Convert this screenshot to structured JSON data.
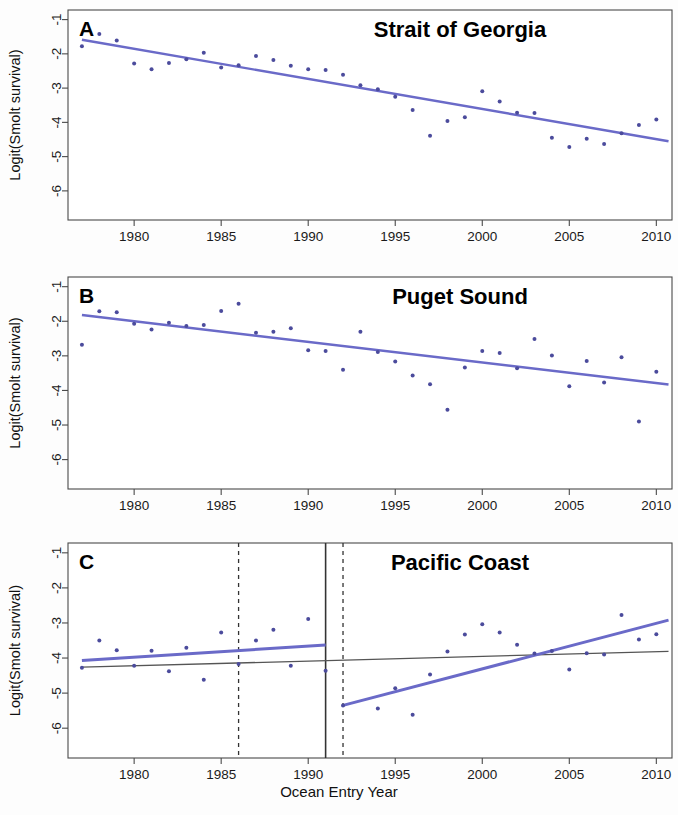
{
  "figure": {
    "xlabel": "Ocean Entry Year",
    "ylabel": "Logit(Smolt survival)",
    "point_color": "#4b4b9c",
    "trend_color": "#6a6ac8",
    "reference_color": "#555555",
    "axis_color": "#4a4a4a"
  },
  "axes": {
    "xticks": [
      1980,
      1985,
      1990,
      1995,
      2000,
      2005,
      2010
    ],
    "xticklabels": [
      "1980",
      "1985",
      "1990",
      "1995",
      "2000",
      "2005",
      "2010"
    ],
    "yticks": [
      -1,
      -2,
      -3,
      -4,
      -5,
      -6
    ],
    "yticklabels": [
      "-1",
      "-2",
      "-3",
      "-4",
      "-5",
      "-6"
    ],
    "xlim": [
      1976.2,
      2010.9
    ],
    "ylim": [
      -6.85,
      -0.72
    ]
  },
  "chart_data": [
    {
      "type": "scatter",
      "panel": "A",
      "title": "Strait of Georgia",
      "xlabel": "",
      "ylabel": "Logit(Smolt survival)",
      "xlim": [
        1976.2,
        2010.9
      ],
      "ylim": [
        -6.85,
        -0.72
      ],
      "grid": false,
      "legend": "none",
      "x": [
        1977,
        1978,
        1979,
        1980,
        1981,
        1982,
        1983,
        1984,
        1985,
        1986,
        1987,
        1988,
        1989,
        1990,
        1991,
        1992,
        1993,
        1994,
        1995,
        1996,
        1997,
        1998,
        1999,
        2000,
        2001,
        2002,
        2003,
        2004,
        2005,
        2006,
        2007,
        2008,
        2009,
        2010
      ],
      "y": [
        -1.78,
        -1.42,
        -1.61,
        -2.28,
        -2.45,
        -2.27,
        -2.16,
        -1.97,
        -2.4,
        -2.33,
        -2.06,
        -2.18,
        -2.35,
        -2.45,
        -2.47,
        -2.61,
        -2.92,
        -3.03,
        -3.25,
        -3.64,
        -4.39,
        -3.96,
        -3.85,
        -3.09,
        -3.39,
        -3.72,
        -3.73,
        -4.45,
        -4.72,
        -4.48,
        -4.63,
        -4.32,
        -4.08,
        -3.92
      ],
      "trend_line": {
        "x": [
          1977.0,
          2010.7
        ],
        "y": [
          -1.59,
          -4.55
        ],
        "label": "linear trend"
      }
    },
    {
      "type": "scatter",
      "panel": "B",
      "title": "Puget Sound",
      "xlabel": "",
      "ylabel": "Logit(Smolt survival)",
      "xlim": [
        1976.2,
        2010.9
      ],
      "ylim": [
        -6.85,
        -0.72
      ],
      "grid": false,
      "legend": "none",
      "x": [
        1977,
        1978,
        1979,
        1980,
        1981,
        1982,
        1983,
        1984,
        1985,
        1986,
        1987,
        1988,
        1989,
        1990,
        1991,
        1992,
        1993,
        1994,
        1995,
        1996,
        1997,
        1998,
        1999,
        2000,
        2001,
        2002,
        2003,
        2004,
        2005,
        2006,
        2007,
        2008,
        2009,
        2010
      ],
      "y": [
        -2.68,
        -1.71,
        -1.74,
        -2.07,
        -2.24,
        -2.04,
        -2.14,
        -2.11,
        -1.7,
        -1.49,
        -2.33,
        -2.3,
        -2.2,
        -2.84,
        -2.86,
        -3.4,
        -2.3,
        -2.89,
        -3.16,
        -3.57,
        -3.82,
        -4.56,
        -3.34,
        -2.86,
        -2.92,
        -3.36,
        -2.51,
        -2.99,
        -3.88,
        -3.15,
        -3.77,
        -3.04,
        -4.9,
        -3.46
      ],
      "trend_line": {
        "x": [
          1977.0,
          2010.7
        ],
        "y": [
          -1.82,
          -3.83
        ],
        "label": "linear trend"
      }
    },
    {
      "type": "scatter",
      "panel": "C",
      "title": "Pacific Coast",
      "xlabel": "Ocean Entry Year",
      "ylabel": "Logit(Smolt survival)",
      "xlim": [
        1976.2,
        2010.9
      ],
      "ylim": [
        -6.85,
        -0.72
      ],
      "grid": false,
      "legend": "none",
      "x": [
        1977,
        1978,
        1979,
        1980,
        1981,
        1982,
        1983,
        1984,
        1985,
        1986,
        1987,
        1988,
        1989,
        1990,
        1991,
        1992,
        1994,
        1995,
        1996,
        1997,
        1998,
        1999,
        2000,
        2001,
        2002,
        2003,
        2004,
        2005,
        2006,
        2007,
        2008,
        2009,
        2010
      ],
      "y": [
        -4.28,
        -3.5,
        -3.78,
        -4.22,
        -3.79,
        -4.38,
        -3.71,
        -4.62,
        -3.27,
        -4.17,
        -3.5,
        -3.19,
        -4.22,
        -2.89,
        -4.36,
        -5.35,
        -5.44,
        -4.86,
        -5.62,
        -4.47,
        -3.81,
        -3.33,
        -3.04,
        -3.27,
        -3.62,
        -3.87,
        -3.8,
        -4.33,
        -3.86,
        -3.9,
        -2.77,
        -3.47,
        -3.32
      ],
      "trend_segments": [
        {
          "name": "early-period trend",
          "x": [
            1977.0,
            1991.0
          ],
          "y": [
            -4.07,
            -3.63
          ]
        },
        {
          "name": "late-period trend",
          "x": [
            1992.0,
            2010.7
          ],
          "y": [
            -5.35,
            -2.92
          ]
        }
      ],
      "reference_line": {
        "name": "overall reference",
        "x": [
          1977.0,
          2010.7
        ],
        "y": [
          -4.26,
          -3.81
        ]
      },
      "vertical_lines": [
        {
          "name": "solid-divider",
          "x": 1991.0,
          "style": "solid"
        },
        {
          "name": "dashed-marker-early",
          "x": 1986.0,
          "style": "dashed"
        },
        {
          "name": "dashed-marker-late",
          "x": 1992.0,
          "style": "dashed"
        }
      ]
    }
  ]
}
